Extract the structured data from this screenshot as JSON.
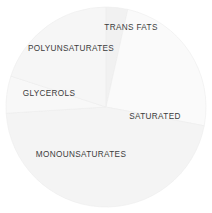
{
  "chart_data": {
    "type": "pie",
    "title": "",
    "subtitle": "",
    "xlabel": "",
    "ylabel": "",
    "legend_position": "none",
    "grid": false,
    "start_angle_deg": 0,
    "direction": "clockwise",
    "background_color": "#ffffff",
    "divider_color": "#ededed",
    "label_color": "#3c3c3c",
    "categories": [
      "TRANS FATS",
      "SATURATED",
      "MONOUNSATURATES",
      "GLYCEROLS",
      "POLYUNSATURATES"
    ],
    "values": [
      3.5,
      24.5,
      46,
      6,
      20
    ],
    "slices": [
      {
        "label": "TRANS FATS",
        "value": 3.5,
        "start_deg": 0,
        "end_deg": 12.6,
        "color": "#f1f1f1",
        "label_x": 131,
        "label_y": 28
      },
      {
        "label": "SATURATED",
        "value": 24.5,
        "start_deg": 12.6,
        "end_deg": 100.8,
        "color": "#fafafa",
        "label_x": 155,
        "label_y": 117
      },
      {
        "label": "MONOUNSATURATES",
        "value": 46,
        "start_deg": 100.8,
        "end_deg": 266.4,
        "color": "#f4f4f4",
        "label_x": 81,
        "label_y": 155
      },
      {
        "label": "GLYCEROLS",
        "value": 6,
        "start_deg": 266.4,
        "end_deg": 288,
        "color": "#f8f8f8",
        "label_x": 49,
        "label_y": 94
      },
      {
        "label": "POLYUNSATURATES",
        "value": 20,
        "start_deg": 288,
        "end_deg": 360,
        "color": "#f6f6f6",
        "label_x": 71,
        "label_y": 49
      }
    ],
    "geometry": {
      "center_x": 106,
      "center_y": 107,
      "radius": 100
    }
  }
}
